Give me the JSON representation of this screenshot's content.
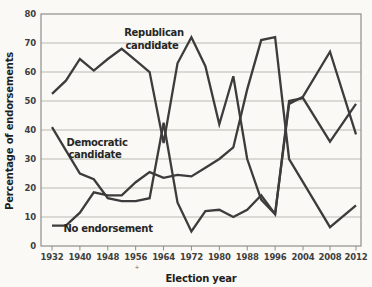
{
  "chart_data": {
    "type": "line",
    "title": "",
    "xlabel": "Election year",
    "ylabel": "Percentage of endorsements",
    "ylim": [
      0,
      80
    ],
    "yticks": [
      0,
      10,
      20,
      30,
      40,
      50,
      60,
      70,
      80
    ],
    "xtick_years": [
      1932,
      1940,
      1948,
      1956,
      1964,
      1972,
      1980,
      1988,
      1996,
      2004,
      2008,
      2012
    ],
    "grid": "horizontal",
    "legend_position": "inline-annotations",
    "line_color": "#3c3c3c",
    "grid_color": "#b3b2ae",
    "border_color": "#8f8e8a",
    "x": [
      1932,
      1936,
      1940,
      1944,
      1948,
      1952,
      1956,
      1960,
      1964,
      1968,
      1972,
      1976,
      1980,
      1984,
      1988,
      1992,
      1996,
      2000,
      2004,
      2008,
      2012
    ],
    "series": [
      {
        "name": "Republican candidate",
        "values": [
          52.5,
          57,
          64.5,
          60.5,
          64.5,
          68,
          64,
          60,
          35.5,
          63,
          72,
          62,
          42,
          58.5,
          30,
          16,
          11,
          50,
          51,
          36,
          49
        ]
      },
      {
        "name": "Democratic candidate",
        "values": [
          41,
          33,
          25,
          23,
          16.5,
          15.5,
          15.5,
          16.5,
          42.5,
          15,
          5,
          12,
          12.5,
          10,
          12.5,
          17.5,
          11,
          49,
          51.5,
          67,
          38.5
        ]
      },
      {
        "name": "No endorsement",
        "values": [
          7,
          7,
          11.5,
          18.5,
          17.5,
          17.5,
          22,
          25.5,
          23.5,
          24.5,
          24,
          27,
          30,
          34,
          54,
          71,
          72,
          30,
          22,
          6.5,
          14
        ]
      }
    ],
    "annotations": [
      {
        "name": "republican",
        "line1": "Republican",
        "line2": "candidate"
      },
      {
        "name": "democratic",
        "line1": "Democratic",
        "line2": "candidate"
      },
      {
        "name": "no-endorsement",
        "line1": "No endorsement",
        "line2": ""
      }
    ],
    "footnote_mark": "+"
  }
}
